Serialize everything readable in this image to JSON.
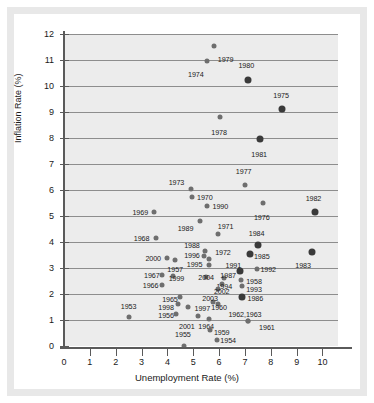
{
  "chart_data": {
    "type": "scatter",
    "title": "",
    "xlabel": "Unemployment Rate (%)",
    "ylabel": "Inflation Rate (%)",
    "xlim": [
      0,
      10.6
    ],
    "ylim": [
      0,
      12
    ],
    "xticks": [
      0,
      1,
      2,
      3,
      4,
      5,
      6,
      7,
      8,
      9,
      10
    ],
    "yticks": [
      0,
      1,
      2,
      3,
      4,
      5,
      6,
      7,
      8,
      9,
      10,
      11,
      12
    ],
    "grid": "horizontal",
    "legend": "none",
    "x_name": "Unemployment Rate (%)",
    "y_name": "Inflation Rate (%)",
    "points": [
      {
        "label": "1979",
        "x": 5.8,
        "y": 11.55,
        "lx": 6.25,
        "ly": 11.05,
        "big": false
      },
      {
        "label": "1974",
        "x": 5.55,
        "y": 10.95,
        "lx": 5.1,
        "ly": 10.45,
        "big": false
      },
      {
        "label": "1980",
        "x": 7.1,
        "y": 10.25,
        "lx": 7.05,
        "ly": 10.8,
        "big": true
      },
      {
        "label": "1975",
        "x": 8.45,
        "y": 9.1,
        "lx": 8.4,
        "ly": 9.65,
        "big": true
      },
      {
        "label": "1978",
        "x": 6.05,
        "y": 8.8,
        "lx": 6.0,
        "ly": 8.25,
        "big": false
      },
      {
        "label": "1981",
        "x": 7.6,
        "y": 7.95,
        "lx": 7.55,
        "ly": 7.4,
        "big": true
      },
      {
        "label": "1977",
        "x": 7.0,
        "y": 6.2,
        "lx": 6.95,
        "ly": 6.75,
        "big": false
      },
      {
        "label": "1973",
        "x": 4.9,
        "y": 6.05,
        "lx": 4.35,
        "ly": 6.3,
        "big": false
      },
      {
        "label": "1970",
        "x": 4.95,
        "y": 5.75,
        "lx": 5.45,
        "ly": 5.75,
        "big": false
      },
      {
        "label": "1976",
        "x": 7.7,
        "y": 5.5,
        "lx": 7.65,
        "ly": 4.95,
        "big": false
      },
      {
        "label": "1990",
        "x": 5.55,
        "y": 5.4,
        "lx": 6.05,
        "ly": 5.4,
        "big": false
      },
      {
        "label": "1982",
        "x": 9.7,
        "y": 5.15,
        "lx": 9.65,
        "ly": 5.7,
        "big": true
      },
      {
        "label": "1969",
        "x": 3.5,
        "y": 5.15,
        "lx": 2.95,
        "ly": 5.15,
        "big": false
      },
      {
        "label": "1989",
        "x": 5.25,
        "y": 4.8,
        "lx": 4.7,
        "ly": 4.55,
        "big": false
      },
      {
        "label": "1971",
        "x": 5.95,
        "y": 4.3,
        "lx": 6.25,
        "ly": 4.6,
        "big": false
      },
      {
        "label": "1968",
        "x": 3.55,
        "y": 4.15,
        "lx": 3.0,
        "ly": 4.15,
        "big": false
      },
      {
        "label": "1984",
        "x": 7.5,
        "y": 3.9,
        "lx": 7.45,
        "ly": 4.35,
        "big": true
      },
      {
        "label": "1988",
        "x": 5.45,
        "y": 3.65,
        "lx": 4.95,
        "ly": 3.9,
        "big": false
      },
      {
        "label": "1983",
        "x": 9.6,
        "y": 3.6,
        "lx": 9.25,
        "ly": 3.1,
        "big": true
      },
      {
        "label": "1985",
        "x": 7.2,
        "y": 3.55,
        "lx": 7.65,
        "ly": 3.45,
        "big": true
      },
      {
        "label": "1996",
        "x": 5.4,
        "y": 3.45,
        "lx": 4.95,
        "ly": 3.5,
        "big": false
      },
      {
        "label": "1972",
        "x": 5.6,
        "y": 3.35,
        "lx": 6.15,
        "ly": 3.6,
        "big": false
      },
      {
        "label": "2000",
        "x": 4.0,
        "y": 3.4,
        "lx": 3.45,
        "ly": 3.4,
        "big": false
      },
      {
        "label": "1957",
        "x": 4.3,
        "y": 3.3,
        "lx": 4.3,
        "ly": 2.95,
        "big": false
      },
      {
        "label": "1995",
        "x": 5.6,
        "y": 3.1,
        "lx": 5.05,
        "ly": 3.15,
        "big": false
      },
      {
        "label": "1991",
        "x": 6.8,
        "y": 2.9,
        "lx": 6.55,
        "ly": 3.1,
        "big": true
      },
      {
        "label": "1992",
        "x": 7.45,
        "y": 2.95,
        "lx": 7.9,
        "ly": 2.95,
        "big": false
      },
      {
        "label": "1967",
        "x": 3.8,
        "y": 2.75,
        "lx": 3.4,
        "ly": 2.75,
        "big": false
      },
      {
        "label": "1999",
        "x": 4.2,
        "y": 2.7,
        "lx": 4.35,
        "ly": 2.6,
        "big": false
      },
      {
        "label": "2004",
        "x": 5.5,
        "y": 2.65,
        "lx": 5.5,
        "ly": 2.65,
        "big": false
      },
      {
        "label": "1987",
        "x": 6.2,
        "y": 2.6,
        "lx": 6.35,
        "ly": 2.75,
        "big": false
      },
      {
        "label": "1958",
        "x": 6.85,
        "y": 2.55,
        "lx": 7.35,
        "ly": 2.5,
        "big": false
      },
      {
        "label": "1994",
        "x": 6.1,
        "y": 2.4,
        "lx": 6.2,
        "ly": 2.3,
        "big": false
      },
      {
        "label": "1993",
        "x": 6.9,
        "y": 2.3,
        "lx": 7.35,
        "ly": 2.2,
        "big": false
      },
      {
        "label": "1966",
        "x": 3.8,
        "y": 2.35,
        "lx": 3.35,
        "ly": 2.35,
        "big": false
      },
      {
        "label": "2002",
        "x": 5.95,
        "y": 2.2,
        "lx": 6.1,
        "ly": 2.1,
        "big": false
      },
      {
        "label": "1986",
        "x": 6.9,
        "y": 1.9,
        "lx": 7.4,
        "ly": 1.85,
        "big": true
      },
      {
        "label": "1965",
        "x": 4.5,
        "y": 1.9,
        "lx": 4.1,
        "ly": 1.8,
        "big": false
      },
      {
        "label": "2003",
        "x": 5.75,
        "y": 1.7,
        "lx": 5.65,
        "ly": 1.85,
        "big": false
      },
      {
        "label": "1998",
        "x": 4.4,
        "y": 1.6,
        "lx": 3.95,
        "ly": 1.5,
        "big": false
      },
      {
        "label": "1960",
        "x": 5.95,
        "y": 1.6,
        "lx": 6.0,
        "ly": 1.5,
        "big": false
      },
      {
        "label": "1997",
        "x": 5.2,
        "y": 1.15,
        "lx": 5.35,
        "ly": 1.45,
        "big": false
      },
      {
        "label": "1956",
        "x": 4.35,
        "y": 1.25,
        "lx": 3.95,
        "ly": 1.2,
        "big": false
      },
      {
        "label": "1953",
        "x": 2.5,
        "y": 1.1,
        "lx": 2.5,
        "ly": 1.55,
        "big": false
      },
      {
        "label": "1962,1963",
        "x": 7.1,
        "y": 0.95,
        "lx": 7.0,
        "ly": 1.25,
        "big": false
      },
      {
        "label": "1961",
        "x": 7.1,
        "y": 0.95,
        "lx": 7.85,
        "ly": 0.75,
        "big": false
      },
      {
        "label": "2001",
        "x": 4.8,
        "y": 1.5,
        "lx": 4.75,
        "ly": 0.78,
        "big": false
      },
      {
        "label": "1964",
        "x": 5.6,
        "y": 1.05,
        "lx": 5.5,
        "ly": 0.78,
        "big": false
      },
      {
        "label": "1959",
        "x": 5.65,
        "y": 0.6,
        "lx": 6.1,
        "ly": 0.55,
        "big": false
      },
      {
        "label": "1955",
        "x": 4.65,
        "y": 0.0,
        "lx": 4.6,
        "ly": 0.45,
        "big": false
      },
      {
        "label": "1954",
        "x": 5.9,
        "y": 0.25,
        "lx": 6.35,
        "ly": 0.25,
        "big": false
      }
    ]
  }
}
